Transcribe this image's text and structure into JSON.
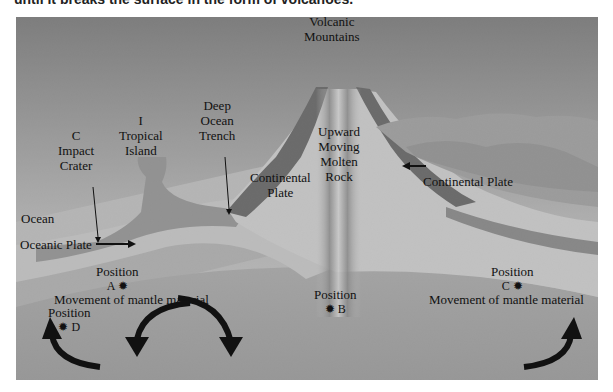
{
  "caption": "until it breaks the surface in the form of volcanoes.",
  "diagram": {
    "labels": {
      "volcanic_mountains": [
        "Volcanic",
        "Mountains"
      ],
      "deep_ocean_trench": [
        "Deep",
        "Ocean",
        "Trench"
      ],
      "tropical_island": [
        "I",
        "Tropical",
        "Island"
      ],
      "impact_crater": [
        "C",
        "Impact",
        "Crater"
      ],
      "ocean": "Ocean",
      "oceanic_plate": "Oceanic Plate",
      "continental_plate_left": [
        "Continental",
        "Plate"
      ],
      "continental_plate_right": "Continental Plate",
      "molten_rock": [
        "Upward",
        "Moving",
        "Molten",
        "Rock"
      ],
      "mantle_left": "Movement of mantle material",
      "mantle_right": "Movement of mantle material"
    },
    "positions": [
      {
        "id": "A",
        "label": "Position",
        "marker": "A ✹"
      },
      {
        "id": "B",
        "label": "Position",
        "marker": "✹ B"
      },
      {
        "id": "C",
        "label": "Position",
        "marker": "C ✹"
      },
      {
        "id": "D",
        "label": "Position",
        "marker": "✹ D"
      }
    ],
    "colors": {
      "sky_top": "#7a7a7a",
      "sky_bottom": "#d8d8d8",
      "ocean": "#b9b9b9",
      "mantle": "#a9a9a9",
      "plate": "#d2d2d2",
      "mountain": "#5a5a5a",
      "arrow": "#111111"
    }
  }
}
